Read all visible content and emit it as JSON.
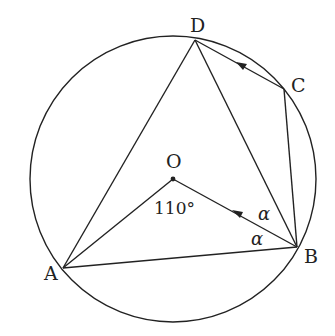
{
  "diagram": {
    "type": "circle-geometry",
    "circle": {
      "center": "O",
      "cx": 173,
      "cy": 179,
      "r": 143
    },
    "points": {
      "A": {
        "label": "A",
        "x": 63,
        "y": 268
      },
      "B": {
        "label": "B",
        "x": 297,
        "y": 247
      },
      "C": {
        "label": "C",
        "x": 284,
        "y": 89
      },
      "D": {
        "label": "D",
        "x": 195,
        "y": 40
      },
      "O": {
        "label": "O",
        "x": 173,
        "y": 179
      }
    },
    "segments": [
      "AD",
      "AB",
      "DB",
      "DC",
      "CB",
      "OA",
      "OB"
    ],
    "arrows": [
      {
        "on": "OB",
        "direction": "toward O"
      },
      {
        "on": "CD",
        "direction": "toward D"
      }
    ],
    "annotations": {
      "angle_AOB": "110°",
      "angle_OBD": "α",
      "angle_ABO": "α"
    }
  },
  "colors": {
    "stroke": "#222222",
    "background": "#ffffff"
  }
}
